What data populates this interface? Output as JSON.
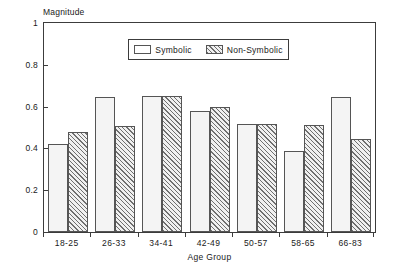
{
  "chart_data": {
    "type": "bar",
    "title": "",
    "ylabel": "Magnitude",
    "xlabel": "Age Group",
    "ylim": [
      0,
      1
    ],
    "yticks": [
      "0",
      "0.2",
      "0.4",
      "0.6",
      "0.8",
      "1"
    ],
    "ytick_values": [
      0,
      0.2,
      0.4,
      0.6,
      0.8,
      1
    ],
    "grid": false,
    "legend_position": "upper-center-inside",
    "categories": [
      "18-25",
      "26-33",
      "34-41",
      "42-49",
      "50-57",
      "58-65",
      "66-83"
    ],
    "series": [
      {
        "name": "Symbolic",
        "fill": "solid-light",
        "values": [
          0.42,
          0.645,
          0.65,
          0.58,
          0.515,
          0.39,
          0.645
        ]
      },
      {
        "name": "Non-Symbolic",
        "fill": "diagonal-hatch",
        "values": [
          0.48,
          0.505,
          0.65,
          0.6,
          0.515,
          0.51,
          0.445
        ]
      }
    ]
  },
  "legend": {
    "entries": [
      {
        "label": "Symbolic",
        "swatch": "empty-box-swatch"
      },
      {
        "label": "Non-Symbolic",
        "swatch": "hatched-box-swatch"
      }
    ]
  },
  "colors": {
    "background": "#ffffff",
    "axis": "#3c3c3c",
    "bar_outline": "#555555",
    "symbolic_fill": "#f4f4f4",
    "hatch_line": "#6f6f6f",
    "text": "#1a1a1a"
  }
}
